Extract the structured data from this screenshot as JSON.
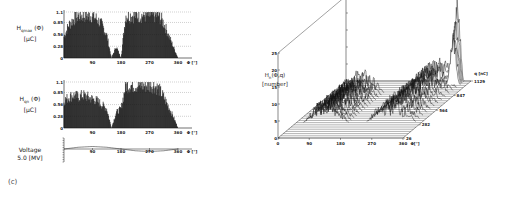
{
  "figure": {
    "panel_label": "(c)"
  },
  "chart_data": [
    {
      "type": "bar",
      "id": "hqmax",
      "title": "",
      "ylabel_main": "H",
      "ylabel_sub": "qmax",
      "ylabel_arg": "(Φ)",
      "ylabel_unit": "[μC]",
      "xlabel": "Φ [°]",
      "xticks": [
        "90",
        "180",
        "270",
        "360"
      ],
      "yticks": [
        "0",
        "0.28",
        "0.56",
        "0.85",
        "1.1"
      ],
      "xlim": [
        0,
        360
      ],
      "ylim": [
        0,
        1.1
      ],
      "grid": "dotted horizontal",
      "x": [
        0,
        15,
        30,
        45,
        60,
        75,
        90,
        105,
        120,
        135,
        150,
        165,
        180,
        195,
        210,
        225,
        240,
        255,
        270,
        285,
        300,
        315,
        330,
        345,
        360
      ],
      "values": [
        0.55,
        0.85,
        1.0,
        1.1,
        1.1,
        1.1,
        1.1,
        1.0,
        0.85,
        0.6,
        0.0,
        0.3,
        0.0,
        1.1,
        1.1,
        1.1,
        1.1,
        1.1,
        1.1,
        1.1,
        1.1,
        0.9,
        0.6,
        0.3,
        0.0
      ]
    },
    {
      "type": "bar",
      "id": "hqn",
      "title": "",
      "ylabel_main": "H",
      "ylabel_sub": "qn",
      "ylabel_arg": "(Φ)",
      "ylabel_unit": "[μC]",
      "xlabel": "Φ [°]",
      "xticks": [
        "90",
        "180",
        "270",
        "360"
      ],
      "yticks": [
        "0",
        "0.28",
        "0.56",
        "0.85",
        "1.1"
      ],
      "xlim": [
        0,
        360
      ],
      "ylim": [
        0,
        1.1
      ],
      "grid": "dotted horizontal",
      "x": [
        0,
        15,
        30,
        45,
        60,
        75,
        90,
        105,
        120,
        135,
        150,
        165,
        180,
        195,
        210,
        225,
        240,
        255,
        270,
        285,
        300,
        315,
        330,
        345,
        360
      ],
      "values": [
        0.7,
        0.8,
        0.85,
        0.8,
        0.85,
        0.8,
        0.75,
        0.7,
        0.6,
        0.5,
        0.0,
        0.4,
        0.5,
        1.1,
        1.1,
        1.1,
        1.1,
        1.1,
        1.1,
        1.1,
        1.0,
        0.8,
        0.55,
        0.3,
        0.0
      ]
    },
    {
      "type": "line",
      "id": "voltage",
      "ylabel_main": "Voltage",
      "ylabel_unit": "5.0 [MV]",
      "xlabel": "Φ [°]",
      "xticks": [
        "90",
        "180",
        "270",
        "360"
      ],
      "xlim": [
        0,
        360
      ],
      "x": [
        0,
        45,
        90,
        135,
        180,
        225,
        270,
        315,
        360
      ],
      "values": [
        0,
        0.7,
        1,
        0.7,
        0,
        -0.7,
        -1,
        -0.7,
        0
      ]
    },
    {
      "type": "surface3d",
      "id": "hn-phi-q",
      "zlabel_main": "H",
      "zlabel_sub": "n",
      "zlabel_arg": "(Φ,q)",
      "zlabel_unit": "[number]",
      "xlabel": "Φ[°]",
      "ylabel": "q [nC]",
      "xticks": [
        "0",
        "90",
        "180",
        "270",
        "360"
      ],
      "yticks": [
        "26",
        "282",
        "564",
        "847",
        "1129"
      ],
      "zticks": [
        "0",
        "5",
        "10",
        "15",
        "20",
        "25"
      ],
      "xlim": [
        0,
        360
      ],
      "ylim": [
        26,
        1129
      ],
      "zlim": [
        0,
        25
      ],
      "clusters": [
        {
          "phi_range": [
            20,
            150
          ],
          "q_range": [
            282,
            900
          ],
          "peak": 6
        },
        {
          "phi_range": [
            200,
            340
          ],
          "q_range": [
            282,
            1129
          ],
          "peak": 6
        },
        {
          "phi_range": [
            300,
            340
          ],
          "q_range": [
            1050,
            1129
          ],
          "peak": 25
        }
      ]
    }
  ]
}
